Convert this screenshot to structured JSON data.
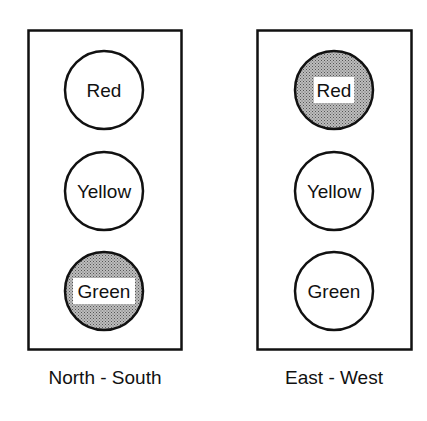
{
  "signals": [
    {
      "direction": "North - South",
      "lights": [
        {
          "label": "Red",
          "active": false
        },
        {
          "label": "Yellow",
          "active": false
        },
        {
          "label": "Green",
          "active": true
        }
      ]
    },
    {
      "direction": "East - West",
      "lights": [
        {
          "label": "Red",
          "active": true
        },
        {
          "label": "Yellow",
          "active": false
        },
        {
          "label": "Green",
          "active": false
        }
      ]
    }
  ],
  "colors": {
    "outline": "#111111",
    "active_fill": "#9a9a9a",
    "inactive_fill": "#ffffff"
  }
}
